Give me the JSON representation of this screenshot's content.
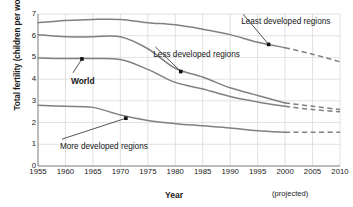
{
  "chart_data": {
    "type": "line",
    "title": "",
    "xlabel": "Year",
    "ylabel": "Total fertility (children per woman)",
    "xlim": [
      1955,
      2010
    ],
    "ylim": [
      0,
      7
    ],
    "grid": true,
    "legend_position": "inline-annotations",
    "xticks": [
      "1955",
      "1960",
      "1965",
      "1970",
      "1975",
      "1980",
      "1985",
      "1990",
      "1995",
      "2000",
      "2005",
      "2010"
    ],
    "yticks": [
      "0",
      "1",
      "2",
      "3",
      "4",
      "5",
      "6",
      "7"
    ],
    "projected_note": "(projected)",
    "projection_starts": 2000,
    "series": [
      {
        "name": "Least developed regions",
        "x": [
          1955,
          1960,
          1965,
          1970,
          1975,
          1980,
          1985,
          1990,
          1995,
          2000,
          2005,
          2010
        ],
        "values": [
          6.6,
          6.7,
          6.75,
          6.75,
          6.6,
          6.5,
          6.3,
          6.05,
          5.7,
          5.45,
          5.15,
          4.8
        ],
        "label_x": 1992,
        "label_y": 6.85,
        "marker_x": 1997,
        "marker_y": 5.6
      },
      {
        "name": "Less developed regions",
        "x": [
          1955,
          1960,
          1965,
          1970,
          1975,
          1980,
          1985,
          1990,
          1995,
          2000,
          2005,
          2010
        ],
        "values": [
          6.05,
          5.95,
          5.95,
          5.95,
          5.4,
          4.5,
          4.1,
          3.6,
          3.25,
          2.9,
          2.75,
          2.6
        ],
        "label_x": 1976,
        "label_y": 5.35,
        "marker_x": 1981,
        "marker_y": 4.35
      },
      {
        "name": "World",
        "x": [
          1955,
          1960,
          1965,
          1970,
          1975,
          1980,
          1985,
          1990,
          1995,
          2000,
          2005,
          2010
        ],
        "values": [
          4.97,
          4.95,
          4.95,
          4.9,
          4.45,
          3.85,
          3.55,
          3.2,
          2.95,
          2.75,
          2.6,
          2.5
        ],
        "label_x": 1961,
        "label_y": 4.15,
        "marker_x": 1963,
        "marker_y": 4.93
      },
      {
        "name": "More developed regions",
        "x": [
          1955,
          1960,
          1965,
          1970,
          1975,
          1980,
          1985,
          1990,
          1995,
          2000,
          2005,
          2010
        ],
        "values": [
          2.8,
          2.75,
          2.7,
          2.35,
          2.1,
          1.95,
          1.85,
          1.75,
          1.62,
          1.55,
          1.55,
          1.55
        ],
        "label_x": 1959,
        "label_y": 1.1,
        "marker_x": 1971,
        "marker_y": 2.2
      }
    ],
    "colors": {
      "line": "#808080",
      "grid": "#d9d9d9",
      "axis": "#8a8a8a",
      "text": "#1a1a1a"
    }
  }
}
